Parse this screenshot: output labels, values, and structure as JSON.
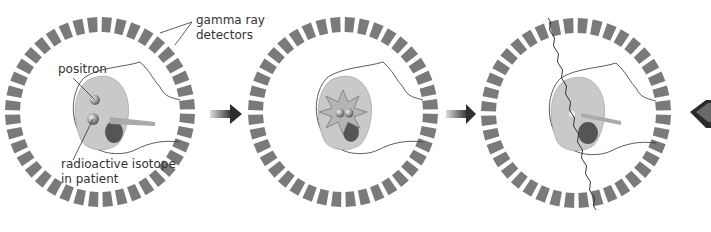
{
  "diagram": {
    "panels": [
      {
        "id": 1,
        "description": "positron emitted by radioactive isotope in patient"
      },
      {
        "id": 2,
        "description": "positron-electron annihilation"
      },
      {
        "id": 3,
        "description": "gamma rays travel to opposite detectors"
      }
    ],
    "labels": {
      "gamma_detectors_line1": "gamma ray",
      "gamma_detectors_line2": "detectors",
      "positron": "positron",
      "isotope_line1": "radioactive isotope",
      "isotope_line2": "in patient"
    },
    "colors": {
      "detector": "#7a7a7a",
      "brain": "#c9c9c9",
      "arrow": "#3a3a3a",
      "text": "#333333"
    }
  }
}
